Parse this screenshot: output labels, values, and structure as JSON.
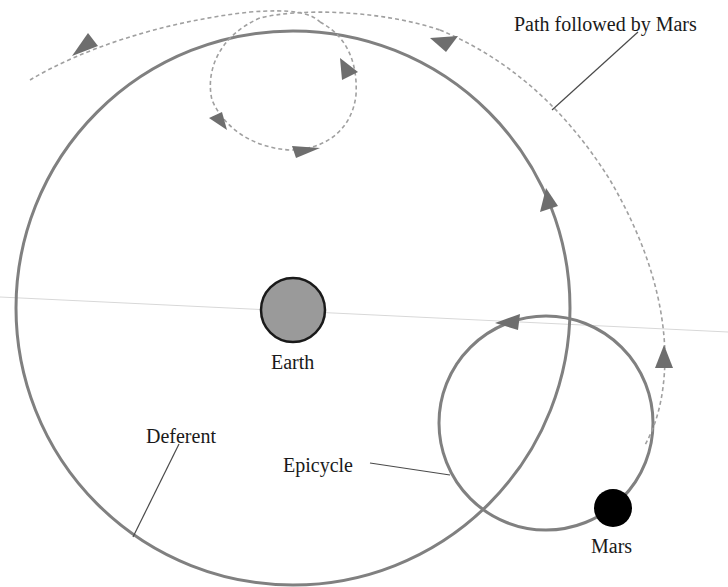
{
  "diagram": {
    "labels": {
      "path": "Path followed by Mars",
      "earth": "Earth",
      "deferent": "Deferent",
      "epicycle": "Epicycle",
      "mars": "Mars"
    },
    "colors": {
      "circle_stroke": "#808080",
      "arrow_fill": "#6e6e6e",
      "path_stroke": "#a0a0a0",
      "earth_fill": "#9a9a9a",
      "earth_stroke": "#1a1a1a",
      "mars_fill": "#000000",
      "leader_line": "#4a4a4a",
      "horizon_line": "#d8d8d8"
    },
    "elements": {
      "deferent": {
        "cx": 293,
        "cy": 308,
        "r": 277
      },
      "epicycle": {
        "cx": 546,
        "cy": 423,
        "r": 107
      },
      "earth": {
        "cx": 293,
        "cy": 310,
        "r": 32
      },
      "mars": {
        "cx": 613,
        "cy": 508,
        "r": 19
      }
    }
  }
}
